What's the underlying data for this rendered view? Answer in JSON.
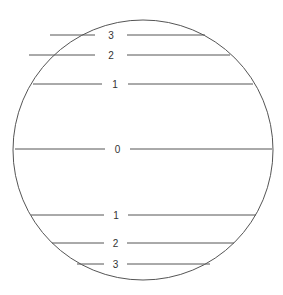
{
  "diagram": {
    "center": [
      143,
      150
    ],
    "radius": 130,
    "stroke": "#555555",
    "lines": [
      {
        "label": "3",
        "y": 35,
        "x1": 50,
        "x2": 205,
        "gap": [
          95,
          127
        ]
      },
      {
        "label": "2",
        "y": 55,
        "x1": 29,
        "x2": 230,
        "gap": [
          95,
          127
        ]
      },
      {
        "label": "1",
        "y": 84,
        "x1": 33,
        "x2": 253,
        "gap": [
          102,
          128
        ]
      },
      {
        "label": "0",
        "y": 149,
        "x1": 15,
        "x2": 272,
        "gap": [
          105,
          130
        ]
      },
      {
        "label": "1",
        "y": 215,
        "x1": 31,
        "x2": 256,
        "gap": [
          104,
          128
        ]
      },
      {
        "label": "2",
        "y": 243,
        "x1": 52,
        "x2": 234,
        "gap": [
          104,
          127
        ]
      },
      {
        "label": "3",
        "y": 264,
        "x1": 77,
        "x2": 210,
        "gap": [
          104,
          127
        ]
      }
    ]
  }
}
